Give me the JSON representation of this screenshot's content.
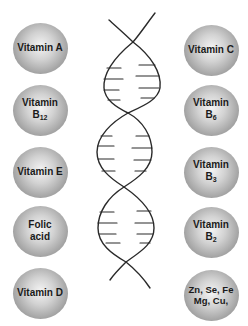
{
  "diagram": {
    "title": "",
    "center_graphic": "dna-double-helix",
    "left_column": [
      {
        "id": "vitamin-a",
        "line1": "Vitamin A",
        "line2": "",
        "sub": "",
        "cx": 40,
        "cy": 48
      },
      {
        "id": "vitamin-b12",
        "line1": "Vitamin",
        "line2": "B",
        "sub": "12",
        "cx": 40,
        "cy": 110
      },
      {
        "id": "vitamin-e",
        "line1": "Vitamin E",
        "line2": "",
        "sub": "",
        "cx": 40,
        "cy": 172
      },
      {
        "id": "folic-acid",
        "line1": "Folic",
        "line2": "acid",
        "sub": "",
        "cx": 40,
        "cy": 231
      },
      {
        "id": "vitamin-d",
        "line1": "Vitamin D",
        "line2": "",
        "sub": "",
        "cx": 40,
        "cy": 293
      }
    ],
    "right_column": [
      {
        "id": "vitamin-c",
        "line1": "Vitamin C",
        "line2": "",
        "sub": "",
        "cx": 211,
        "cy": 50
      },
      {
        "id": "vitamin-b6",
        "line1": "Vitamin",
        "line2": "B",
        "sub": "6",
        "cx": 211,
        "cy": 110
      },
      {
        "id": "vitamin-b3",
        "line1": "Vitamin",
        "line2": "B",
        "sub": "3",
        "cx": 211,
        "cy": 172
      },
      {
        "id": "vitamin-b2",
        "line1": "Vitamin",
        "line2": "B",
        "sub": "2",
        "cx": 211,
        "cy": 232
      },
      {
        "id": "minerals",
        "line1": "Zn, Se, Fe",
        "line2": "Mg, Cu,",
        "sub": "",
        "cx": 211,
        "cy": 295
      }
    ],
    "colors": {
      "ball_highlight": "#f4f4f4",
      "ball_shadow": "#7a7a7a",
      "text": "#1a1a1a",
      "helix_stroke": "#2a2a2a",
      "background": "#ffffff"
    }
  }
}
